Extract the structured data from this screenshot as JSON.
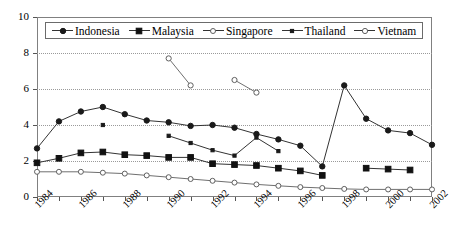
{
  "chart_data": {
    "type": "line",
    "title": "",
    "xlabel": "",
    "ylabel": "",
    "xlim": [
      1984,
      2002
    ],
    "ylim": [
      0,
      10
    ],
    "yticks": [
      0,
      2,
      4,
      6,
      8,
      10
    ],
    "xticks": [
      1984,
      1985,
      1986,
      1987,
      1988,
      1989,
      1990,
      1991,
      1992,
      1993,
      1994,
      1995,
      1996,
      1997,
      1998,
      1999,
      2000,
      2001,
      2002
    ],
    "xtick_labels": [
      "1984",
      "",
      "1986",
      "",
      "1988",
      "",
      "1990",
      "",
      "1992",
      "",
      "1994",
      "",
      "1996",
      "",
      "1998",
      "",
      "2000",
      "",
      "2002"
    ],
    "xtick_labels_shown": [
      "1984",
      "1986",
      "1988",
      "1990",
      "1992",
      "1994",
      "1996",
      "1998",
      "2000",
      "2002"
    ],
    "grid": "horizontal-dotted",
    "legend_position": "top-inside",
    "x": [
      1984,
      1985,
      1986,
      1987,
      1988,
      1989,
      1990,
      1991,
      1992,
      1993,
      1994,
      1995,
      1996,
      1997,
      1998,
      1999,
      2000,
      2001,
      2002
    ],
    "series": [
      {
        "name": "Indonesia",
        "marker": "filled-circle",
        "values": [
          2.7,
          4.2,
          4.75,
          5.0,
          4.6,
          4.25,
          4.15,
          3.95,
          4.0,
          3.85,
          3.5,
          3.2,
          2.85,
          1.7,
          6.2,
          4.35,
          3.7,
          3.55,
          2.9
        ]
      },
      {
        "name": "Malaysia",
        "marker": "filled-square",
        "values": [
          1.9,
          2.15,
          2.45,
          2.5,
          2.35,
          2.3,
          2.2,
          2.2,
          1.85,
          1.8,
          1.75,
          1.6,
          1.45,
          1.2,
          null,
          1.6,
          1.55,
          1.5,
          null
        ]
      },
      {
        "name": "Singapore",
        "marker": "open-circle",
        "values": [
          1.4,
          1.4,
          1.4,
          1.35,
          1.3,
          1.2,
          1.1,
          1.0,
          0.9,
          0.8,
          0.7,
          0.62,
          0.55,
          0.5,
          0.45,
          0.42,
          0.42,
          0.42,
          0.42
        ]
      },
      {
        "name": "Thailand",
        "marker": "filled-small",
        "values": [
          null,
          null,
          null,
          4.0,
          null,
          null,
          3.4,
          3.0,
          2.6,
          2.3,
          3.3,
          2.55,
          null,
          null,
          null,
          null,
          null,
          null,
          null
        ]
      },
      {
        "name": "Vietnam",
        "marker": "open-circle-small",
        "values": [
          null,
          null,
          null,
          null,
          null,
          null,
          7.7,
          6.2,
          null,
          6.5,
          5.8,
          null,
          null,
          null,
          null,
          null,
          null,
          null,
          null
        ]
      }
    ]
  },
  "legend": {
    "entries": [
      {
        "label": "Indonesia",
        "marker": "filled-circle"
      },
      {
        "label": "Malaysia",
        "marker": "filled-square"
      },
      {
        "label": "Singapore",
        "marker": "open-circle"
      },
      {
        "label": "Thailand",
        "marker": "filled-small"
      },
      {
        "label": "Vietnam",
        "marker": "open-circle-small"
      }
    ]
  },
  "axes": {
    "y_labels": [
      "10",
      "8",
      "6",
      "4",
      "2",
      "0"
    ],
    "x_labels": [
      "1984",
      "1986",
      "1988",
      "1990",
      "1992",
      "1994",
      "1996",
      "1998",
      "2000",
      "2002"
    ]
  },
  "colors": {
    "frame": "#808080",
    "grid": "#9a9a9a",
    "line_dark": "#333333",
    "line_gray": "#6f6f6f",
    "marker_fill": "#1a1a1a",
    "marker_open": "#ffffff",
    "background": "#ffffff"
  }
}
